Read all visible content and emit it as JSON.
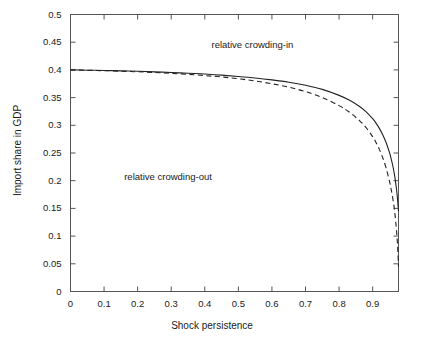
{
  "chart_data": {
    "type": "line",
    "title": "",
    "xlabel": "Shock persistence",
    "ylabel": "Import share in GDP",
    "xlim": [
      0,
      0.977
    ],
    "ylim": [
      0,
      0.5
    ],
    "grid": false,
    "legend": "none",
    "xticks": [
      "0",
      "0.1",
      "0.2",
      "0.3",
      "0.4",
      "0.5",
      "0.6",
      "0.7",
      "0.8",
      "0.9"
    ],
    "xtick_values": [
      0,
      0.1,
      0.2,
      0.3,
      0.4,
      0.5,
      0.6,
      0.7,
      0.8,
      0.9
    ],
    "yticks": [
      "0",
      "0.05",
      "0.1",
      "0.15",
      "0.2",
      "0.25",
      "0.3",
      "0.35",
      "0.4",
      "0.45",
      "0.5"
    ],
    "ytick_values": [
      0,
      0.05,
      0.1,
      0.15,
      0.2,
      0.25,
      0.3,
      0.35,
      0.4,
      0.45,
      0.5
    ],
    "series": [
      {
        "name": "solid-threshold-curve",
        "style": "solid",
        "color": "#222222",
        "x": [
          0.0,
          0.05,
          0.1,
          0.15,
          0.2,
          0.25,
          0.3,
          0.35,
          0.4,
          0.45,
          0.5,
          0.55,
          0.6,
          0.65,
          0.7,
          0.75,
          0.8,
          0.83,
          0.86,
          0.88,
          0.9,
          0.91,
          0.92,
          0.93,
          0.94,
          0.95,
          0.955,
          0.96,
          0.965,
          0.97,
          0.973,
          0.975,
          0.977
        ],
        "y": [
          0.4,
          0.3995,
          0.399,
          0.3983,
          0.3975,
          0.3965,
          0.3953,
          0.394,
          0.3925,
          0.3905,
          0.3882,
          0.3855,
          0.382,
          0.3778,
          0.3722,
          0.3648,
          0.354,
          0.3455,
          0.3345,
          0.3248,
          0.312,
          0.304,
          0.2945,
          0.283,
          0.269,
          0.251,
          0.24,
          0.227,
          0.211,
          0.19,
          0.174,
          0.16,
          0.145
        ]
      },
      {
        "name": "dashed-threshold-curve",
        "style": "dashed",
        "color": "#222222",
        "x": [
          0.0,
          0.05,
          0.1,
          0.15,
          0.2,
          0.25,
          0.3,
          0.35,
          0.4,
          0.45,
          0.5,
          0.55,
          0.6,
          0.65,
          0.7,
          0.75,
          0.8,
          0.83,
          0.86,
          0.88,
          0.9,
          0.91,
          0.92,
          0.93,
          0.94,
          0.95,
          0.955,
          0.96,
          0.965,
          0.97,
          0.973,
          0.975,
          0.977
        ],
        "y": [
          0.4,
          0.3993,
          0.3986,
          0.3977,
          0.3966,
          0.3953,
          0.3938,
          0.392,
          0.3898,
          0.3872,
          0.384,
          0.38,
          0.375,
          0.3688,
          0.3608,
          0.3502,
          0.3355,
          0.324,
          0.309,
          0.2962,
          0.2795,
          0.269,
          0.2565,
          0.2415,
          0.223,
          0.1995,
          0.185,
          0.168,
          0.147,
          0.118,
          0.095,
          0.074,
          0.045
        ]
      }
    ],
    "annotations": [
      {
        "name": "relative-crowding-in",
        "text": "relative crowding-in",
        "x": 0.42,
        "y": 0.445
      },
      {
        "name": "relative-crowding-out",
        "text": "relative crowding-out",
        "x": 0.16,
        "y": 0.207
      }
    ]
  },
  "axis_label_x": "Shock persistence",
  "axis_label_y": "Import share in GDP"
}
